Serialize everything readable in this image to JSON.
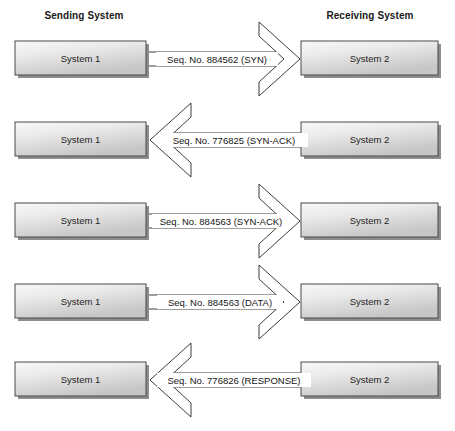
{
  "diagram": {
    "headers": {
      "left": "Sending System",
      "right": "Receiving System"
    },
    "node_labels": {
      "left": "System 1",
      "right": "System 2"
    },
    "colors": {
      "background": "#ffffff",
      "box_fill_light": "#f2f2f2",
      "box_fill_dark": "#c9c9c9",
      "box_border": "#4a4a4a",
      "box_shadow": "#8d8d8d",
      "line": "#3d3d3d",
      "text": "#1a1a1a"
    },
    "rows": [
      {
        "index": 1,
        "left_node": "System 1",
        "right_node": "System 2",
        "message": "Seq. No. 884562 (SYN)",
        "direction": "right"
      },
      {
        "index": 2,
        "left_node": "System 1",
        "right_node": "System 2",
        "message": "Seq. No. 776825 (SYN-ACK)",
        "direction": "left"
      },
      {
        "index": 3,
        "left_node": "System 1",
        "right_node": "System 2",
        "message": "Seq. No. 884563 (SYN-ACK)",
        "direction": "right"
      },
      {
        "index": 4,
        "left_node": "System 1",
        "right_node": "System 2",
        "message": "Seq. No. 884563 (DATA)",
        "direction": "right"
      },
      {
        "index": 5,
        "left_node": "System 1",
        "right_node": "System 2",
        "message": "Seq. No. 776826 (RESPONSE)",
        "direction": "left"
      }
    ]
  }
}
